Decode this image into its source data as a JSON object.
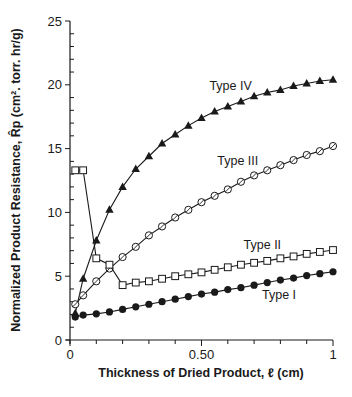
{
  "chart_data": {
    "type": "line",
    "title": "",
    "xlabel": "Thickness of Dried Product, ℓ (cm)",
    "ylabel": "Normalized Product Resistance, R̂p (cm². torr. hr/g)",
    "xlim": [
      0,
      1
    ],
    "ylim": [
      0,
      25
    ],
    "x_ticks": [
      0,
      0.5,
      1
    ],
    "x_tick_labels": [
      "0",
      "0.50",
      "1"
    ],
    "x_minor_step": 0.1,
    "y_ticks": [
      0,
      5,
      10,
      15,
      20,
      25
    ],
    "y_tick_labels": [
      "0",
      "5",
      "10",
      "15",
      "20",
      "25"
    ],
    "y_minor_step": 1,
    "grid": false,
    "legend": "inline labels",
    "series": [
      {
        "name": "Type IV",
        "marker": "filled-triangle",
        "label_pos": [
          0.53,
          19.6
        ],
        "x": [
          0.02,
          0.05,
          0.1,
          0.15,
          0.2,
          0.25,
          0.3,
          0.35,
          0.4,
          0.45,
          0.5,
          0.55,
          0.6,
          0.65,
          0.7,
          0.75,
          0.8,
          0.85,
          0.9,
          0.95,
          1.0
        ],
        "values": [
          2.1,
          4.8,
          7.8,
          10.2,
          12.0,
          13.4,
          14.4,
          15.4,
          16.1,
          16.8,
          17.4,
          17.9,
          18.3,
          18.7,
          19.1,
          19.4,
          19.6,
          19.9,
          20.1,
          20.3,
          20.4
        ]
      },
      {
        "name": "Type III",
        "marker": "open-circle",
        "label_pos": [
          0.56,
          13.7
        ],
        "x": [
          0.02,
          0.05,
          0.1,
          0.15,
          0.2,
          0.25,
          0.3,
          0.35,
          0.4,
          0.45,
          0.5,
          0.55,
          0.6,
          0.65,
          0.7,
          0.75,
          0.8,
          0.85,
          0.9,
          0.95,
          1.0
        ],
        "values": [
          2.8,
          3.5,
          4.6,
          5.6,
          6.5,
          7.3,
          8.2,
          8.9,
          9.6,
          10.2,
          10.8,
          11.3,
          11.8,
          12.4,
          12.9,
          13.3,
          13.7,
          14.1,
          14.5,
          14.8,
          15.2
        ]
      },
      {
        "name": "Type II",
        "marker": "open-square",
        "label_pos": [
          0.66,
          7.1
        ],
        "x": [
          0.02,
          0.05,
          0.1,
          0.15,
          0.2,
          0.25,
          0.3,
          0.35,
          0.4,
          0.45,
          0.5,
          0.55,
          0.6,
          0.65,
          0.7,
          0.75,
          0.8,
          0.85,
          0.9,
          0.95,
          1.0
        ],
        "values": [
          13.3,
          13.3,
          6.4,
          5.9,
          4.3,
          4.5,
          4.6,
          4.8,
          5.0,
          5.15,
          5.3,
          5.5,
          5.7,
          5.9,
          6.05,
          6.2,
          6.4,
          6.55,
          6.75,
          6.9,
          7.05
        ]
      },
      {
        "name": "Type I",
        "marker": "filled-circle",
        "label_pos": [
          0.73,
          3.2
        ],
        "x": [
          0.02,
          0.05,
          0.1,
          0.15,
          0.2,
          0.25,
          0.3,
          0.35,
          0.4,
          0.45,
          0.5,
          0.55,
          0.6,
          0.65,
          0.7,
          0.75,
          0.8,
          0.85,
          0.9,
          0.95,
          1.0
        ],
        "values": [
          1.8,
          1.95,
          2.05,
          2.2,
          2.4,
          2.6,
          2.8,
          3.0,
          3.2,
          3.4,
          3.6,
          3.75,
          3.95,
          4.1,
          4.3,
          4.5,
          4.7,
          4.85,
          5.05,
          5.2,
          5.35
        ]
      }
    ]
  }
}
